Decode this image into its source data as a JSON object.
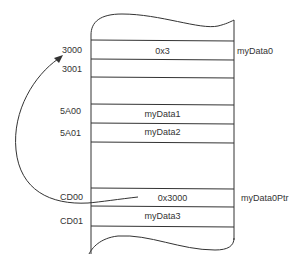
{
  "diagram": {
    "type": "memory-map",
    "addresses": [
      "3000",
      "3001",
      "5A00",
      "5A01",
      "CD00",
      "CD01"
    ],
    "cells": [
      {
        "address": "3000",
        "value": "0x3",
        "name": "myData0"
      },
      {
        "address": "3001",
        "value": "",
        "name": ""
      },
      {
        "address": "5A00",
        "value": "myData1",
        "name": ""
      },
      {
        "address": "5A01",
        "value": "myData2",
        "name": ""
      },
      {
        "address": "CD00",
        "value": "0x3000",
        "name": "myData0Ptr"
      },
      {
        "address": "CD01",
        "value": "myData3",
        "name": ""
      }
    ],
    "arrow": {
      "from": "CD00",
      "to": "3000"
    },
    "line_color": "#333333"
  }
}
